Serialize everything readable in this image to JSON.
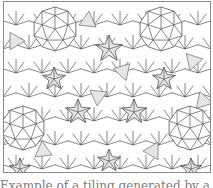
{
  "figure": {
    "colors": {
      "stroke": "#555555",
      "shade": "#e6e6e6",
      "background": "#ffffff",
      "frame": "#8a8a8a"
    },
    "decagons": [
      {
        "cx": 52,
        "cy": 28,
        "r": 22
      },
      {
        "cx": 158,
        "cy": 28,
        "r": 22
      },
      {
        "cx": 20,
        "cy": 127,
        "r": 22
      },
      {
        "cx": 187,
        "cy": 127,
        "r": 22
      }
    ],
    "stars": [
      {
        "cx": 106,
        "cy": 48,
        "r": 14
      },
      {
        "cx": 51,
        "cy": 78,
        "r": 12
      },
      {
        "cx": 161,
        "cy": 78,
        "r": 12
      },
      {
        "cx": 75,
        "cy": 111,
        "r": 13
      },
      {
        "cx": 131,
        "cy": 111,
        "r": 13
      },
      {
        "cx": 17,
        "cy": 168,
        "r": 11
      },
      {
        "cx": 188,
        "cy": 168,
        "r": 11
      },
      {
        "cx": 106,
        "cy": 160,
        "r": 12
      }
    ]
  },
  "caption": {
    "text": "Example of a tiling generated by a strip pattern (clipped)"
  }
}
